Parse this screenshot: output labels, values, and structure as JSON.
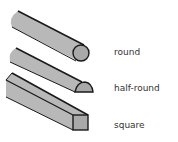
{
  "diagram": {
    "colors": {
      "fill": "#b8b8b8",
      "end_fill": "#a9a9a9",
      "stroke": "#1a1a1a",
      "text": "#333333"
    },
    "items": [
      {
        "shape": "round",
        "label": "round"
      },
      {
        "shape": "half-round",
        "label": "half-round"
      },
      {
        "shape": "square",
        "label": "square"
      }
    ]
  }
}
